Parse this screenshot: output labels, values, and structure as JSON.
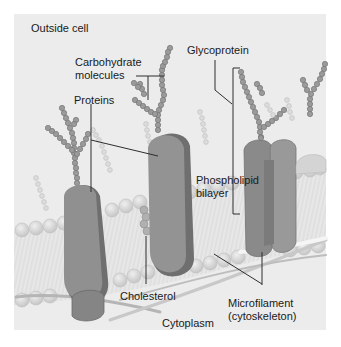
{
  "diagram": {
    "regions": {
      "outside": "Outside cell",
      "inside": "Cytoplasm"
    },
    "labels": {
      "carbohydrate_line1": "Carbohydrate",
      "carbohydrate_line2": "molecules",
      "proteins": "Proteins",
      "glycoprotein": "Glycoprotein",
      "phospholipid_line1": "Phospholipid",
      "phospholipid_line2": "bilayer",
      "cholesterol": "Cholesterol",
      "microfilament_line1": "Microfilament",
      "microfilament_line2": "(cytoskeleton)"
    },
    "colors": {
      "background": "#ececec",
      "protein": "#8f8f8f",
      "protein_shadow": "#6f6f6f",
      "lipid_head": "#d9d9d9",
      "chain_dark": "#909090",
      "chain_light": "#cfcfcf",
      "leader_line": "#333333"
    }
  }
}
